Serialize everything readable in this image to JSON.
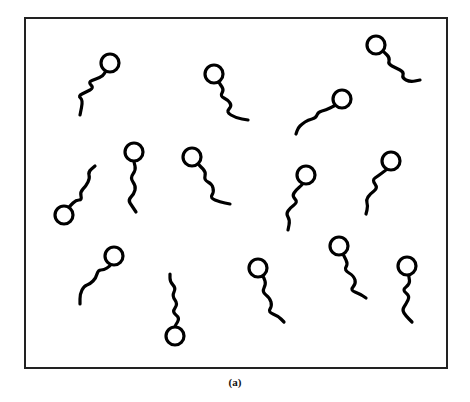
{
  "figure": {
    "caption": "(a)",
    "frame": {
      "x": 25,
      "y": 18,
      "width": 422,
      "height": 350,
      "stroke": "#222222",
      "stroke_width": 2
    },
    "molecule_style": {
      "stroke": "#000000",
      "stroke_width": 3.2,
      "head_radius": 9
    },
    "molecules": [
      {
        "id": 1,
        "head": [
          110,
          63
        ],
        "tail": [
          [
            103,
            76
          ],
          [
            96,
            79
          ],
          [
            88,
            82
          ],
          [
            94,
            88
          ],
          [
            86,
            92
          ],
          [
            78,
            96
          ],
          [
            83,
            100
          ],
          [
            80,
            115
          ]
        ]
      },
      {
        "id": 2,
        "head": [
          214,
          74
        ],
        "tail": [
          [
            220,
            84
          ],
          [
            224,
            90
          ],
          [
            220,
            96
          ],
          [
            228,
            100
          ],
          [
            232,
            106
          ],
          [
            226,
            112
          ],
          [
            236,
            118
          ],
          [
            248,
            120
          ]
        ]
      },
      {
        "id": 3,
        "head": [
          376,
          45
        ],
        "tail": [
          [
            384,
            52
          ],
          [
            390,
            58
          ],
          [
            388,
            64
          ],
          [
            396,
            68
          ],
          [
            404,
            72
          ],
          [
            402,
            78
          ],
          [
            410,
            82
          ],
          [
            420,
            80
          ]
        ]
      },
      {
        "id": 4,
        "head": [
          342,
          99
        ],
        "tail": [
          [
            334,
            106
          ],
          [
            326,
            110
          ],
          [
            318,
            112
          ],
          [
            316,
            118
          ],
          [
            308,
            120
          ],
          [
            302,
            124
          ],
          [
            298,
            128
          ],
          [
            296,
            134
          ]
        ]
      },
      {
        "id": 5,
        "head": [
          64,
          215
        ],
        "tail": [
          [
            70,
            206
          ],
          [
            76,
            200
          ],
          [
            82,
            200
          ],
          [
            80,
            192
          ],
          [
            86,
            186
          ],
          [
            90,
            178
          ],
          [
            88,
            172
          ],
          [
            95,
            166
          ]
        ]
      },
      {
        "id": 6,
        "head": [
          134,
          152
        ],
        "tail": [
          [
            134,
            162
          ],
          [
            136,
            170
          ],
          [
            130,
            178
          ],
          [
            136,
            186
          ],
          [
            134,
            194
          ],
          [
            128,
            200
          ],
          [
            132,
            206
          ],
          [
            136,
            212
          ]
        ]
      },
      {
        "id": 7,
        "head": [
          192,
          157
        ],
        "tail": [
          [
            200,
            166
          ],
          [
            206,
            172
          ],
          [
            204,
            180
          ],
          [
            212,
            184
          ],
          [
            214,
            192
          ],
          [
            210,
            198
          ],
          [
            220,
            202
          ],
          [
            230,
            204
          ]
        ]
      },
      {
        "id": 8,
        "head": [
          306,
          175
        ],
        "tail": [
          [
            302,
            185
          ],
          [
            296,
            190
          ],
          [
            292,
            196
          ],
          [
            298,
            202
          ],
          [
            290,
            208
          ],
          [
            286,
            214
          ],
          [
            290,
            220
          ],
          [
            288,
            230
          ]
        ]
      },
      {
        "id": 9,
        "head": [
          391,
          161
        ],
        "tail": [
          [
            386,
            170
          ],
          [
            378,
            176
          ],
          [
            372,
            180
          ],
          [
            378,
            188
          ],
          [
            370,
            194
          ],
          [
            366,
            200
          ],
          [
            368,
            206
          ],
          [
            366,
            214
          ]
        ]
      },
      {
        "id": 10,
        "head": [
          114,
          256
        ],
        "tail": [
          [
            110,
            266
          ],
          [
            104,
            270
          ],
          [
            98,
            270
          ],
          [
            96,
            278
          ],
          [
            90,
            284
          ],
          [
            84,
            286
          ],
          [
            80,
            294
          ],
          [
            80,
            304
          ]
        ]
      },
      {
        "id": 11,
        "head": [
          175,
          336
        ],
        "tail": [
          [
            175,
            326
          ],
          [
            180,
            318
          ],
          [
            172,
            312
          ],
          [
            178,
            304
          ],
          [
            172,
            296
          ],
          [
            176,
            288
          ],
          [
            170,
            282
          ],
          [
            170,
            274
          ]
        ]
      },
      {
        "id": 12,
        "head": [
          258,
          268
        ],
        "tail": [
          [
            264,
            278
          ],
          [
            266,
            284
          ],
          [
            262,
            292
          ],
          [
            270,
            298
          ],
          [
            272,
            306
          ],
          [
            268,
            312
          ],
          [
            278,
            316
          ],
          [
            284,
            322
          ]
        ]
      },
      {
        "id": 13,
        "head": [
          339,
          246
        ],
        "tail": [
          [
            344,
            256
          ],
          [
            348,
            264
          ],
          [
            344,
            270
          ],
          [
            354,
            276
          ],
          [
            356,
            284
          ],
          [
            350,
            290
          ],
          [
            360,
            294
          ],
          [
            366,
            298
          ]
        ]
      },
      {
        "id": 14,
        "head": [
          407,
          266
        ],
        "tail": [
          [
            409,
            277
          ],
          [
            410,
            284
          ],
          [
            402,
            290
          ],
          [
            410,
            296
          ],
          [
            406,
            304
          ],
          [
            402,
            310
          ],
          [
            406,
            316
          ],
          [
            412,
            322
          ]
        ]
      }
    ]
  }
}
